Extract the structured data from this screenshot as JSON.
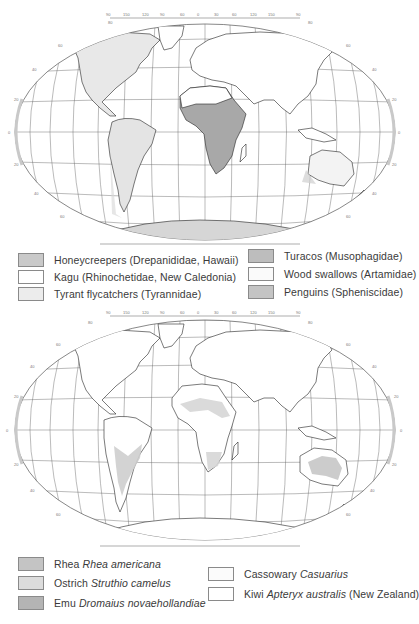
{
  "maps": [
    {
      "id": "families",
      "projection": "Robinson-like world projection",
      "longitude_ticks": [
        "90",
        "150",
        "120",
        "90",
        "60",
        "30",
        "0",
        "30",
        "60",
        "90",
        "120",
        "150",
        "180"
      ],
      "latitude_ticks": [
        "80",
        "60",
        "40",
        "20",
        "0",
        "20",
        "40",
        "60",
        "80"
      ],
      "shaded_regions": [
        {
          "name": "North America",
          "color": "#e6e6e6"
        },
        {
          "name": "South America",
          "color": "#e2e2e2"
        },
        {
          "name": "Sub-Saharan Africa",
          "color": "#a9a9a9"
        },
        {
          "name": "Australia coasts",
          "color": "#d0d0d0"
        },
        {
          "name": "New Zealand",
          "color": "#c8c8c8"
        },
        {
          "name": "Antarctic coast",
          "color": "#d2d2d2"
        }
      ],
      "legend": [
        {
          "label": "Honeycreepers (Drepanididae, Hawaii)",
          "swatch": "#c9c9c9"
        },
        {
          "label": "Kagu (Rhinochetidae, New Caledonia)",
          "swatch": "#ffffff"
        },
        {
          "label": "Tyrant flycatchers (Tyrannidae)",
          "swatch": "#ececec"
        },
        {
          "label": "Turacos (Musophagidae)",
          "swatch": "#bdbdbd"
        },
        {
          "label": "Wood swallows (Artamidae)",
          "swatch": "#fafafa"
        },
        {
          "label": "Penguins (Spheniscidae)",
          "swatch": "#c4c4c4"
        }
      ]
    },
    {
      "id": "ratites",
      "projection": "Robinson-like world projection",
      "longitude_ticks": [
        "90",
        "150",
        "120",
        "90",
        "60",
        "30",
        "0",
        "30",
        "60",
        "90",
        "120",
        "150",
        "180"
      ],
      "latitude_ticks": [
        "80",
        "60",
        "40",
        "20",
        "0",
        "20",
        "40",
        "60",
        "80"
      ],
      "shaded_regions": [
        {
          "name": "South America (Rhea)",
          "color": "#cfcfcf"
        },
        {
          "name": "North Africa (Ostrich)",
          "color": "#d6d6d6"
        },
        {
          "name": "Southern Africa (Ostrich)",
          "color": "#d6d6d6"
        },
        {
          "name": "Australia (Emu)",
          "color": "#c6c6c6"
        }
      ],
      "legend": [
        {
          "common": "Rhea",
          "scientific": "Rhea americana",
          "suffix": "",
          "swatch": "#c4c4c4"
        },
        {
          "common": "Ostrich",
          "scientific": "Struthio camelus",
          "suffix": "",
          "swatch": "#dcdcdc"
        },
        {
          "common": "Emu",
          "scientific": "Dromaius novaehollandiae",
          "suffix": "",
          "swatch": "#b4b4b4"
        },
        {
          "common": "Cassowary",
          "scientific": "Casuarius",
          "suffix": "",
          "swatch": "#fbfbfb"
        },
        {
          "common": "Kiwi",
          "scientific": "Apteryx australis",
          "suffix": "(New Zealand)",
          "swatch": "#ffffff"
        }
      ]
    }
  ]
}
